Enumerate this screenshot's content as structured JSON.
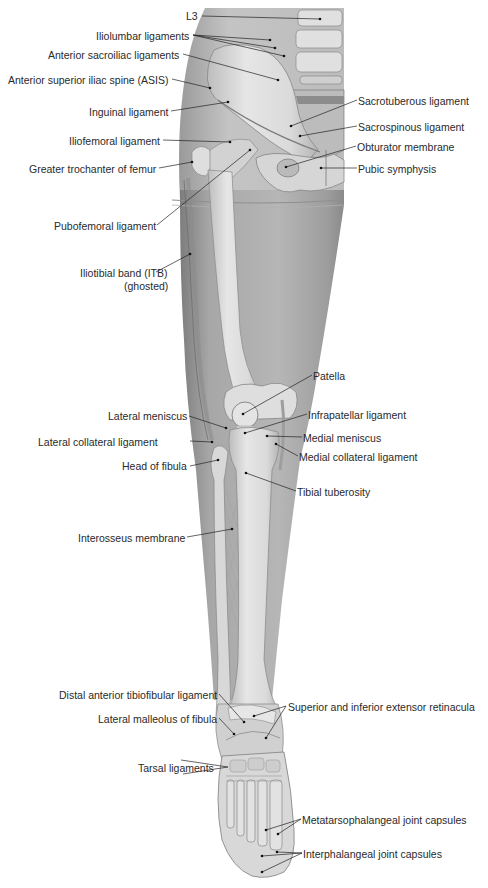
{
  "figure": {
    "colors": {
      "background": "#ffffff",
      "skin_ghost": "#a9a9a9",
      "skin_ghost_dark": "#8c8c8c",
      "bone": "#dcdcdc",
      "bone_shadow": "#bdbdbd",
      "ligament": "#c8c8c8",
      "text": "#2a2a2a",
      "leader": "#222222"
    },
    "labels": [
      {
        "id": "l3",
        "text": "L3",
        "side": "left",
        "x": 186,
        "y": 10
      },
      {
        "id": "iliolumbar",
        "text": "Iliolumbar ligaments",
        "side": "left",
        "x": 96,
        "y": 31
      },
      {
        "id": "ant-sacroiliac",
        "text": "Anterior sacroiliac ligaments",
        "side": "left",
        "x": 48,
        "y": 50
      },
      {
        "id": "asis",
        "text": "Anterior superior iliac spine (ASIS)",
        "side": "left",
        "x": 8,
        "y": 75
      },
      {
        "id": "inguinal",
        "text": "Inguinal ligament",
        "side": "left",
        "x": 89,
        "y": 107
      },
      {
        "id": "iliofemoral",
        "text": "Iliofemoral ligament",
        "side": "left",
        "x": 69,
        "y": 136
      },
      {
        "id": "greater-trochanter",
        "text": "Greater trochanter of femur",
        "side": "left",
        "x": 29,
        "y": 164
      },
      {
        "id": "pubofemoral",
        "text": "Pubofemoral ligament",
        "side": "left",
        "x": 54,
        "y": 221
      },
      {
        "id": "itb",
        "text": "Iliotibial band (ITB)",
        "side": "left",
        "x": 80,
        "y": 268
      },
      {
        "id": "itb-ghosted",
        "text": "(ghosted)",
        "side": "left",
        "x": 124,
        "y": 281
      },
      {
        "id": "sacrotuberous",
        "text": "Sacrotuberous ligament",
        "side": "right",
        "x": 358,
        "y": 96
      },
      {
        "id": "sacrospinous",
        "text": "Sacrospinous ligament",
        "side": "right",
        "x": 358,
        "y": 122
      },
      {
        "id": "obturator",
        "text": "Obturator membrane",
        "side": "right",
        "x": 357,
        "y": 142
      },
      {
        "id": "pubic-symphysis",
        "text": "Pubic symphysis",
        "side": "right",
        "x": 358,
        "y": 164
      },
      {
        "id": "patella",
        "text": "Patella",
        "side": "right",
        "x": 313,
        "y": 371
      },
      {
        "id": "infrapatellar",
        "text": "Infrapatellar ligament",
        "side": "right",
        "x": 308,
        "y": 410
      },
      {
        "id": "medial-meniscus",
        "text": "Medial meniscus",
        "side": "right",
        "x": 303,
        "y": 433
      },
      {
        "id": "medial-collateral",
        "text": "Medial collateral ligament",
        "side": "right",
        "x": 299,
        "y": 452
      },
      {
        "id": "tibial-tuberosity",
        "text": "Tibial tuberosity",
        "side": "right",
        "x": 297,
        "y": 487
      },
      {
        "id": "lateral-meniscus",
        "text": "Lateral meniscus",
        "side": "left",
        "x": 108,
        "y": 411
      },
      {
        "id": "lateral-collateral",
        "text": "Lateral collateral ligament",
        "side": "left",
        "x": 38,
        "y": 437
      },
      {
        "id": "head-fibula",
        "text": "Head of fibula",
        "side": "left",
        "x": 122,
        "y": 461
      },
      {
        "id": "interosseus",
        "text": "Interosseus membrane",
        "side": "left",
        "x": 78,
        "y": 533
      },
      {
        "id": "distal-tibiofibular",
        "text": "Distal anterior tibiofibular ligament",
        "side": "left",
        "x": 59,
        "y": 690
      },
      {
        "id": "retinacula",
        "text": "Superior and inferior extensor retinacula",
        "side": "right",
        "x": 288,
        "y": 702
      },
      {
        "id": "lateral-malleolus",
        "text": "Lateral malleolus of fibula",
        "side": "left",
        "x": 98,
        "y": 714
      },
      {
        "id": "tarsal",
        "text": "Tarsal ligaments",
        "side": "left",
        "x": 138,
        "y": 763
      },
      {
        "id": "mtp-capsules",
        "text": "Metatarsophalangeal joint capsules",
        "side": "right",
        "x": 302,
        "y": 815
      },
      {
        "id": "ip-capsules",
        "text": "Interphalangeal joint capsules",
        "side": "right",
        "x": 303,
        "y": 849
      }
    ],
    "caption_partial": ""
  }
}
